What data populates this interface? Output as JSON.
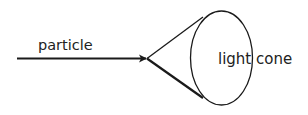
{
  "diagram": {
    "labels": {
      "particle": "particle",
      "light": "light",
      "cone": "cone"
    },
    "colors": {
      "stroke": "#1a1a1a",
      "text": "#222222",
      "background": "#ffffff"
    }
  }
}
